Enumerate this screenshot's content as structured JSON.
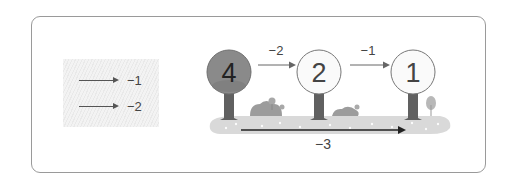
{
  "legend": {
    "items": [
      {
        "label": "−1"
      },
      {
        "label": "−2"
      }
    ]
  },
  "scene": {
    "trees": [
      {
        "value": "4",
        "highlighted": true
      },
      {
        "value": "2",
        "highlighted": false
      },
      {
        "value": "1",
        "highlighted": false
      }
    ],
    "steps": [
      {
        "from": "4",
        "to": "2",
        "label": "−2"
      },
      {
        "from": "2",
        "to": "1",
        "label": "−1"
      }
    ],
    "total": {
      "label": "−3"
    }
  },
  "colors": {
    "highlight_fill": "#8a8a8a",
    "circle_fill": "#fafafa",
    "trunk": "#5c5c5c",
    "ground": "#d6d6d6",
    "arrow": "#333333"
  }
}
